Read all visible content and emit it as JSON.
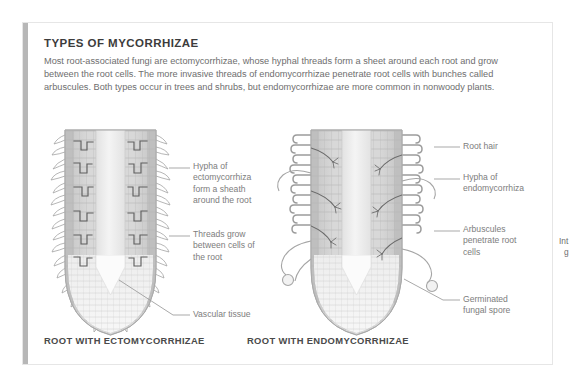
{
  "panel": {
    "title": "TYPES OF MYCORRHIZAE",
    "body": "Most root-associated fungi are ectomycorrhizae, whose hyphal threads form a sheet around each root and grow between the root cells. The more invasive threads of endomycorrhizae penetrate root cells with bunches called arbuscules. Both types occur in trees and shrubs, but endomycorrhizae are more common in nonwoody plants.",
    "accent_color": "#b7b7b7",
    "border_color": "#e6e6e6",
    "background": "#ffffff"
  },
  "diagrams": {
    "left": {
      "caption": "ROOT WITH ECTOMYCORRHIZAE",
      "labels": [
        "Hypha of ectomycorrhiza form a sheath around the root",
        "Threads grow between cells of the root",
        "Vascular tissue"
      ]
    },
    "right": {
      "caption": "ROOT WITH ENDOMYCORRHIZAE",
      "labels": [
        "Root hair",
        "Hypha of endomycorrhiza",
        "Arbuscules penetrate root cells",
        "Germinated fungal spore"
      ]
    }
  },
  "edge_text": {
    "line1": "Int",
    "line2": "g"
  },
  "colors": {
    "title_text": "#3c3c3c",
    "body_text": "#6e6e6e",
    "label_text": "#7d7d7d",
    "caption_text": "#4a4a4a",
    "leader_line": "#9a9a9a",
    "root_fill": "#d7d7d7",
    "root_core": "#ececec",
    "hypha": "#8e8e8e",
    "cell_line": "#b0b0b0"
  }
}
